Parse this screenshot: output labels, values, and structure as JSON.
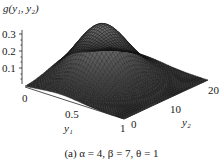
{
  "figure": {
    "zlabel": "g(y₁, y₂)",
    "z_ticks": [
      "0.3",
      "0.2",
      "0.1"
    ],
    "y1_label": "y₁",
    "y1_ticks": [
      "0",
      "0.5",
      "1"
    ],
    "y2_label": "y₂",
    "y2_ticks": [
      "0",
      "10",
      "20"
    ],
    "caption": "(a) α = 4, β = 7, θ = 1"
  },
  "chart_data": {
    "type": "surface3d",
    "title": "",
    "caption": "(a) α = 4, β = 7, θ = 1",
    "xlabel": "y1",
    "ylabel": "y2",
    "zlabel": "g(y1, y2)",
    "x_ticks": [
      0,
      0.5,
      1
    ],
    "y_ticks": [
      0,
      10,
      20
    ],
    "z_ticks": [
      0.1,
      0.2,
      0.3
    ],
    "xlim": [
      0,
      1
    ],
    "ylim": [
      0,
      20
    ],
    "zlim": [
      0,
      0.35
    ],
    "params": {
      "alpha": 4,
      "beta": 7,
      "theta": 1
    },
    "peak": {
      "y1": 0.35,
      "y2": 10,
      "z": 0.35
    },
    "grid": "wireframe mesh"
  }
}
